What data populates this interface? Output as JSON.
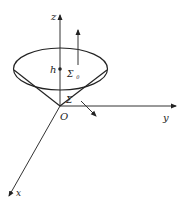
{
  "diagram": {
    "type": "3d-coordinate-surface",
    "axes": {
      "z": {
        "label": "z"
      },
      "y": {
        "label": "y"
      },
      "x": {
        "label": "x"
      }
    },
    "origin_label": "O",
    "height_label": "h",
    "surfaces": {
      "top_disk": {
        "label": "Σ",
        "subscript": "0"
      },
      "lateral": {
        "label": "Σ"
      }
    },
    "colors": {
      "stroke": "#222222",
      "background": "#ffffff"
    }
  }
}
